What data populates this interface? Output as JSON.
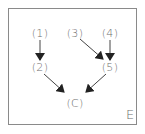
{
  "diagram": {
    "type": "directed-graph",
    "corner_label": "E",
    "colors": {
      "border": "#8a8a8a",
      "text": "#6e6e6e",
      "arrow": "#222222"
    },
    "nodes": [
      {
        "id": "n1",
        "label": "(1)",
        "x": 40,
        "y": 33
      },
      {
        "id": "n2",
        "label": "(2)",
        "x": 40,
        "y": 67
      },
      {
        "id": "n3",
        "label": "(3)",
        "x": 75,
        "y": 33
      },
      {
        "id": "n4",
        "label": "(4)",
        "x": 110,
        "y": 33
      },
      {
        "id": "n5",
        "label": "(5)",
        "x": 110,
        "y": 67
      },
      {
        "id": "nC",
        "label": "(C)",
        "x": 75,
        "y": 103
      }
    ],
    "edges": [
      {
        "from": "(1)",
        "to": "(2)"
      },
      {
        "from": "(3)",
        "to": "(5)"
      },
      {
        "from": "(4)",
        "to": "(5)"
      },
      {
        "from": "(2)",
        "to": "(C)"
      },
      {
        "from": "(5)",
        "to": "(C)"
      }
    ]
  }
}
